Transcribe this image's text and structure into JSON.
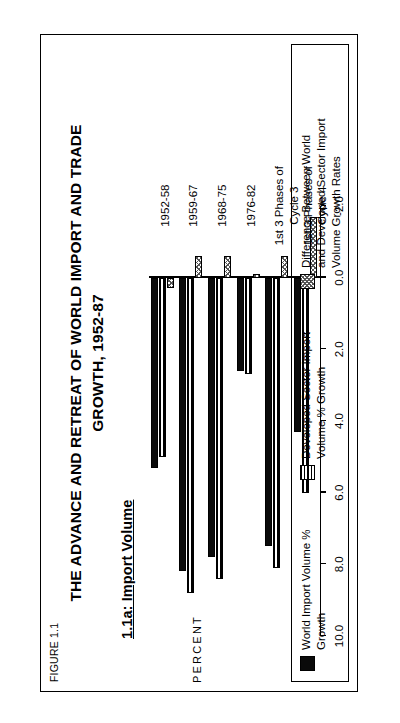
{
  "figure": {
    "figure_label": "FIGURE 1.1",
    "title_line1": "THE ADVANCE AND RETREAT OF WORLD IMPORT AND TRADE",
    "title_line2": "GROWTH, 1952-87",
    "panel_label": "1.1a:  Import Volume",
    "orientation_note": "rotated-landscape"
  },
  "legend": {
    "items": [
      {
        "name": "world-import-volume",
        "label": "World Import Volume % Growth",
        "pattern": "solid",
        "color": "#0a0a0a"
      },
      {
        "name": "developed-sector-import-volume",
        "label": "Developed Sector Import Volume % Growth",
        "pattern": "striped",
        "color": "#000000"
      },
      {
        "name": "difference",
        "label": "Difference Between World and Developed Sector Import Volume Growth Rates",
        "pattern": "checker",
        "color": "#555555"
      }
    ]
  },
  "axis": {
    "value_axis_title": "PERCENT",
    "tick_labels": [
      "10.0",
      "8.0",
      "6.0",
      "4.0",
      "2.0",
      "0.0",
      "-2.0"
    ],
    "tick_values": [
      10.0,
      8.0,
      6.0,
      4.0,
      2.0,
      0.0,
      -2.0
    ]
  },
  "chart_data": {
    "type": "bar",
    "title": "THE ADVANCE AND RETREAT OF WORLD IMPORT AND TRADE GROWTH, 1952-87",
    "subtitle": "1.1a:  Import Volume",
    "orientation": "horizontal",
    "xlabel": "",
    "ylabel": "PERCENT",
    "ylim": [
      -2.0,
      10.0
    ],
    "ticks": [
      10.0,
      8.0,
      6.0,
      4.0,
      2.0,
      0.0,
      -2.0
    ],
    "grid": false,
    "legend_position": "bottom",
    "categories": [
      "1952-58",
      "1959-67",
      "1968-75",
      "1976-82",
      "1st 3 Phases of Cycle 3",
      "1st 3 Phases of Cycle 4"
    ],
    "series": [
      {
        "name": "World Import Volume % Growth",
        "pattern": "solid",
        "values": [
          5.3,
          8.2,
          7.8,
          2.6,
          7.5,
          4.3
        ]
      },
      {
        "name": "Developed Sector Import Volume % Growth",
        "pattern": "striped",
        "values": [
          5.0,
          8.8,
          8.4,
          2.7,
          8.1,
          6.0
        ]
      },
      {
        "name": "Difference Between World and Developed Sector Import Volume Growth Rates",
        "pattern": "checker",
        "values": [
          0.3,
          -0.6,
          -0.6,
          -0.1,
          -0.6,
          -1.7
        ]
      }
    ]
  }
}
